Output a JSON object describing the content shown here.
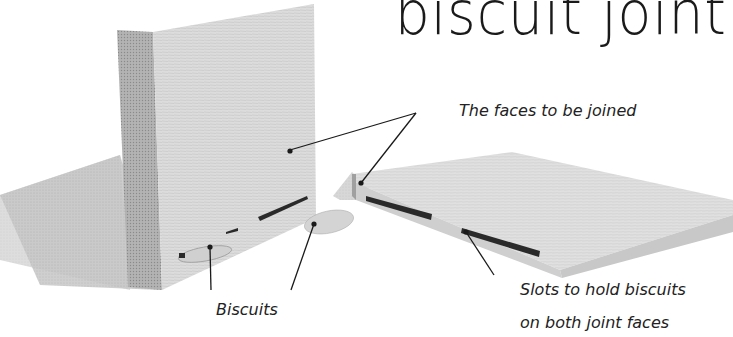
{
  "title": "biscuit joint",
  "labels": {
    "faces": "The faces to be joined",
    "biscuits": "Biscuits",
    "slots_line1": "Slots to hold biscuits",
    "slots_line2": "on both joint faces"
  },
  "colors": {
    "background": "#ffffff",
    "wood_face": "#d9d9d9",
    "wood_end_grain": "#a9a9a9",
    "shadow": "#bdbdbd",
    "slot": "#2a2a2a",
    "leader_line": "#1a1a1a",
    "text": "#222222"
  }
}
